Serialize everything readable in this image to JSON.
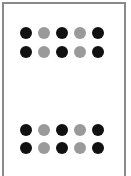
{
  "figure": {
    "colors": {
      "dark": "#111111",
      "light": "#9a9a9a",
      "frame": "#8a8a8a",
      "background": "#ffffff"
    },
    "dot_x_centers": [
      26,
      44,
      62,
      80,
      98
    ],
    "groups": [
      {
        "name": "top-group",
        "rows": [
          {
            "y": 33,
            "pattern": [
              "dark",
              "light",
              "dark",
              "light",
              "dark"
            ]
          },
          {
            "y": 52,
            "pattern": [
              "dark",
              "light",
              "dark",
              "light",
              "dark"
            ]
          }
        ]
      },
      {
        "name": "bottom-group",
        "rows": [
          {
            "y": 130,
            "pattern": [
              "dark",
              "light",
              "dark",
              "light",
              "dark"
            ]
          },
          {
            "y": 148,
            "pattern": [
              "dark",
              "light",
              "dark",
              "light",
              "dark"
            ]
          }
        ]
      }
    ]
  }
}
